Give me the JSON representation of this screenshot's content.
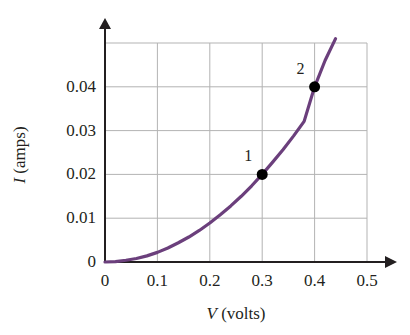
{
  "chart_data": {
    "type": "line",
    "title": "",
    "subtitle": "",
    "xlabel_var": "V",
    "xlabel_unit": " (volts)",
    "ylabel_var": "I",
    "ylabel_unit": " (amps)",
    "xlim": [
      0,
      0.5
    ],
    "ylim": [
      0,
      0.05
    ],
    "grid": true,
    "legend": "none",
    "curve_color": "#6b3f7c",
    "grid_color": "#b3b3b3",
    "axis_color": "#231f20",
    "marker_color": "#000000",
    "xticks": [
      "0",
      "0.1",
      "0.2",
      "0.3",
      "0.4",
      "0.5"
    ],
    "xtick_values": [
      0,
      0.1,
      0.2,
      0.3,
      0.4,
      0.5
    ],
    "yticks": [
      "0",
      "0.01",
      "0.02",
      "0.03",
      "0.04"
    ],
    "ytick_values": [
      0,
      0.01,
      0.02,
      0.03,
      0.04
    ],
    "series": [
      {
        "name": "I-V curve",
        "x": [
          0.0,
          0.02,
          0.04,
          0.06,
          0.08,
          0.1,
          0.12,
          0.14,
          0.16,
          0.18,
          0.2,
          0.22,
          0.24,
          0.26,
          0.28,
          0.3,
          0.32,
          0.34,
          0.36,
          0.38,
          0.4,
          0.42,
          0.44
        ],
        "y": [
          0.0,
          0.0001,
          0.0004,
          0.0008,
          0.0014,
          0.0022,
          0.0032,
          0.0044,
          0.0057,
          0.0072,
          0.0089,
          0.0108,
          0.0128,
          0.015,
          0.0174,
          0.02,
          0.0228,
          0.0257,
          0.0288,
          0.0321,
          0.04,
          0.046,
          0.051
        ]
      }
    ],
    "annotations": [
      {
        "label": "1",
        "x": 0.3,
        "y": 0.02,
        "marker": true
      },
      {
        "label": "2",
        "x": 0.4,
        "y": 0.04,
        "marker": true
      }
    ]
  }
}
